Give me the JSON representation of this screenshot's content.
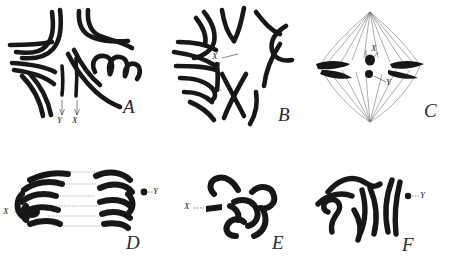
{
  "figure": {
    "background_color": "#ffffff",
    "ink_color": "#171717",
    "type": "scientific-illustration",
    "panel_count": 6
  },
  "panels": [
    {
      "id": "A",
      "letter": "A",
      "labels": [
        {
          "text": "Y",
          "target": "y-chromosome"
        },
        {
          "text": "X",
          "target": "x-chromosome"
        }
      ]
    },
    {
      "id": "B",
      "letter": "B",
      "labels": [
        {
          "text": "X",
          "target": "x-chromosome"
        }
      ]
    },
    {
      "id": "C",
      "letter": "C",
      "labels": [
        {
          "text": "X",
          "target": "x-chromosome"
        },
        {
          "text": "Y",
          "target": "y-chromosome"
        }
      ]
    },
    {
      "id": "D",
      "letter": "D",
      "labels": [
        {
          "text": "X",
          "target": "x-chromosome"
        },
        {
          "text": "Y",
          "target": "y-chromosome"
        }
      ]
    },
    {
      "id": "E",
      "letter": "E",
      "labels": [
        {
          "text": "X",
          "target": "x-chromosome"
        }
      ]
    },
    {
      "id": "F",
      "letter": "F",
      "labels": [
        {
          "text": "Y",
          "target": "y-chromosome"
        }
      ]
    }
  ]
}
